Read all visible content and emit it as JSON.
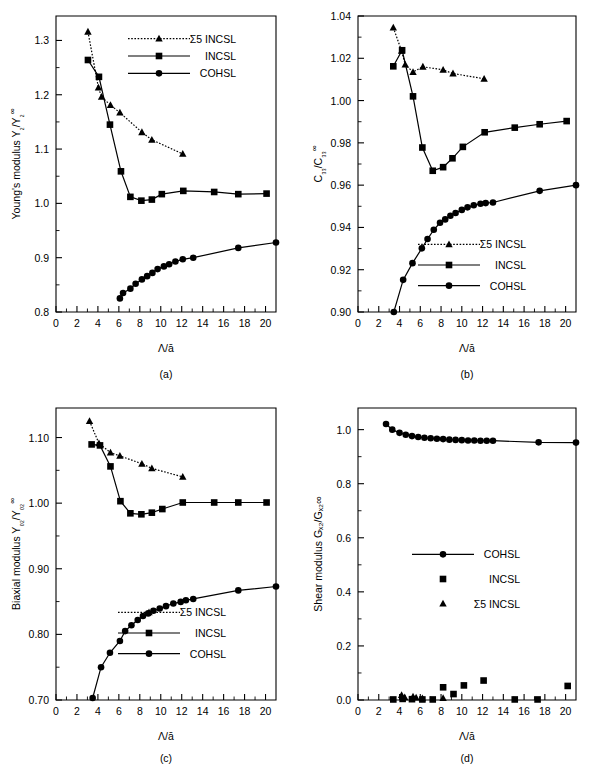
{
  "figure": {
    "panels": [
      "(a)",
      "(b)",
      "(c)",
      "(d)"
    ],
    "xlabel": "Λ/ā"
  },
  "chart_data": [
    {
      "type": "scatter",
      "panel": "(a)",
      "title": "",
      "xlabel": "Λ/ā",
      "ylabel": "Young's modulus Y₂/Y₂∞",
      "xlim": [
        0,
        21
      ],
      "ylim": [
        0.8,
        1.345
      ],
      "xticks": [
        0,
        2,
        4,
        6,
        8,
        10,
        12,
        14,
        16,
        18,
        20
      ],
      "yticks": [
        0.8,
        0.9,
        1.0,
        1.1,
        1.2,
        1.3
      ],
      "ytick_labels": [
        "0.8",
        "0.9",
        "1.0",
        "1.1",
        "1.2",
        "1.3"
      ],
      "grid": false,
      "legend_position": "top-right",
      "series": [
        {
          "name": "Σ5  INCSL",
          "marker": "triangle",
          "linestyle": "dotted",
          "x": [
            3.05,
            4.05,
            4.35,
            5.2,
            6.1,
            8.2,
            9.15,
            12.1
          ],
          "y": [
            1.316,
            1.213,
            1.196,
            1.181,
            1.167,
            1.131,
            1.117,
            1.091
          ]
        },
        {
          "name": "INCSL",
          "marker": "square",
          "linestyle": "solid",
          "x": [
            3.05,
            4.1,
            5.15,
            6.2,
            7.1,
            8.15,
            9.15,
            10.1,
            12.15,
            15.1,
            17.4,
            20.1
          ],
          "y": [
            1.264,
            1.233,
            1.145,
            1.059,
            1.012,
            1.005,
            1.007,
            1.017,
            1.023,
            1.021,
            1.017,
            1.018
          ]
        },
        {
          "name": "COHSL",
          "marker": "circle",
          "linestyle": "solid",
          "x": [
            6.1,
            6.4,
            7.1,
            7.6,
            8.2,
            8.7,
            9.2,
            9.7,
            10.3,
            10.8,
            11.4,
            12.1,
            13.1,
            17.4,
            21.0
          ],
          "y": [
            0.825,
            0.835,
            0.843,
            0.852,
            0.86,
            0.866,
            0.872,
            0.879,
            0.884,
            0.888,
            0.893,
            0.897,
            0.9,
            0.918,
            0.928
          ]
        }
      ]
    },
    {
      "type": "scatter",
      "panel": "(b)",
      "title": "",
      "xlabel": "Λ/ā",
      "ylabel": "C₃₃/C₃₃∞",
      "xlim": [
        0,
        21
      ],
      "ylim": [
        0.9,
        1.04
      ],
      "xticks": [
        0,
        2,
        4,
        6,
        8,
        10,
        12,
        14,
        16,
        18,
        20
      ],
      "yticks": [
        0.9,
        0.92,
        0.94,
        0.96,
        0.98,
        1.0,
        1.02,
        1.04
      ],
      "ytick_labels": [
        "0.90",
        "0.92",
        "0.94",
        "0.96",
        "0.98",
        "1.00",
        "1.02",
        "1.04"
      ],
      "grid": false,
      "legend_position": "bottom-right",
      "series": [
        {
          "name": "Σ5  INCSL",
          "marker": "triangle",
          "linestyle": "dotted",
          "x": [
            3.4,
            4.2,
            4.55,
            5.3,
            6.25,
            8.2,
            9.15,
            12.15
          ],
          "y": [
            1.0345,
            1.0235,
            1.017,
            1.0135,
            1.016,
            1.0145,
            1.0128,
            1.0103
          ]
        },
        {
          "name": "INCSL",
          "marker": "square",
          "linestyle": "solid",
          "x": [
            3.4,
            4.25,
            5.3,
            6.2,
            7.2,
            8.2,
            9.1,
            10.1,
            12.2,
            15.1,
            17.5,
            20.1
          ],
          "y": [
            1.0162,
            1.0238,
            1.002,
            0.9778,
            0.9668,
            0.9685,
            0.9727,
            0.9781,
            0.985,
            0.9872,
            0.9888,
            0.9903
          ]
        },
        {
          "name": "COHSL",
          "marker": "circle",
          "linestyle": "solid",
          "x": [
            3.45,
            4.35,
            5.25,
            6.15,
            6.7,
            7.3,
            7.9,
            8.4,
            8.9,
            9.4,
            10.0,
            10.55,
            11.15,
            11.8,
            12.3,
            13.0,
            17.5,
            21.0
          ],
          "y": [
            0.9,
            0.9152,
            0.9231,
            0.9301,
            0.9345,
            0.9389,
            0.9422,
            0.9438,
            0.9455,
            0.9468,
            0.9483,
            0.9495,
            0.9505,
            0.9512,
            0.9515,
            0.9518,
            0.9573,
            0.96
          ]
        }
      ]
    },
    {
      "type": "scatter",
      "panel": "(c)",
      "title": "",
      "xlabel": "Λ/ā",
      "ylabel": "Biaxial modulus Y₀₂/Y₀₂∞",
      "xlim": [
        0,
        21
      ],
      "ylim": [
        0.7,
        1.145
      ],
      "xticks": [
        0,
        2,
        4,
        6,
        8,
        10,
        12,
        14,
        16,
        18,
        20
      ],
      "yticks": [
        0.7,
        0.8,
        0.9,
        1.0,
        1.1
      ],
      "ytick_labels": [
        "0.70",
        "0.80",
        "0.90",
        "1.00",
        "1.10"
      ],
      "grid": false,
      "legend_position": "bottom-right",
      "series": [
        {
          "name": "Σ5  INCSL",
          "marker": "triangle",
          "linestyle": "dotted",
          "x": [
            3.2,
            4.1,
            5.2,
            6.1,
            8.2,
            9.15,
            12.1
          ],
          "y": [
            1.125,
            1.091,
            1.077,
            1.072,
            1.06,
            1.053,
            1.04
          ]
        },
        {
          "name": "INCSL",
          "marker": "square",
          "linestyle": "solid",
          "x": [
            3.4,
            4.2,
            5.2,
            6.15,
            7.1,
            8.15,
            9.15,
            10.15,
            12.1,
            15.1,
            17.4,
            20.1
          ],
          "y": [
            1.0895,
            1.088,
            1.056,
            1.003,
            0.9845,
            0.983,
            0.9855,
            0.991,
            1.001,
            1.001,
            1.001,
            1.001
          ]
        },
        {
          "name": "COHSL",
          "marker": "circle",
          "linestyle": "solid",
          "x": [
            3.5,
            4.3,
            5.15,
            6.1,
            6.6,
            7.2,
            7.8,
            8.3,
            8.8,
            9.3,
            9.9,
            10.5,
            11.2,
            11.9,
            12.4,
            13.1,
            17.4,
            21.0
          ],
          "y": [
            0.703,
            0.75,
            0.772,
            0.79,
            0.805,
            0.814,
            0.822,
            0.828,
            0.832,
            0.836,
            0.8395,
            0.843,
            0.847,
            0.8495,
            0.852,
            0.854,
            0.867,
            0.873
          ]
        }
      ]
    },
    {
      "type": "scatter",
      "panel": "(d)",
      "title": "",
      "xlabel": "Λ/ā",
      "ylabel": "Shear modulus Gₓ₂/Gₓ₂∞",
      "xlim": [
        0,
        21
      ],
      "ylim": [
        0.0,
        1.08
      ],
      "xticks": [
        0,
        2,
        4,
        6,
        8,
        10,
        12,
        14,
        16,
        18,
        20
      ],
      "yticks": [
        0.0,
        0.2,
        0.4,
        0.6,
        0.8,
        1.0
      ],
      "ytick_labels": [
        "0.0",
        "0.2",
        "0.4",
        "0.6",
        "0.8",
        "1.0"
      ],
      "grid": false,
      "legend_position": "center-right",
      "series": [
        {
          "name": "COHSL",
          "marker": "circle",
          "linestyle": "solid",
          "x": [
            2.7,
            3.3,
            4.0,
            4.6,
            5.2,
            5.8,
            6.4,
            7.0,
            7.6,
            8.2,
            8.8,
            9.4,
            10.0,
            10.6,
            11.2,
            11.8,
            12.4,
            13.0,
            17.4,
            21.0
          ],
          "y": [
            1.021,
            1.0,
            0.988,
            0.981,
            0.976,
            0.973,
            0.97,
            0.968,
            0.966,
            0.965,
            0.963,
            0.962,
            0.961,
            0.96,
            0.96,
            0.959,
            0.959,
            0.959,
            0.953,
            0.952
          ]
        },
        {
          "name": "INCSL",
          "marker": "square",
          "linestyle": "none",
          "x": [
            3.4,
            4.3,
            5.2,
            6.2,
            7.2,
            8.2,
            9.2,
            10.2,
            12.1,
            15.1,
            17.3,
            20.2
          ],
          "y": [
            0.002,
            0.004,
            0.003,
            0.002,
            0.002,
            0.047,
            0.022,
            0.054,
            0.072,
            0.002,
            0.002,
            0.052
          ]
        },
        {
          "name": "Σ5  INCSL",
          "marker": "triangle",
          "linestyle": "none",
          "x": [
            4.2,
            4.5,
            5.3,
            5.6,
            6.2,
            8.2
          ],
          "y": [
            0.018,
            0.01,
            0.012,
            0.009,
            0.006,
            0.007
          ]
        }
      ]
    }
  ]
}
